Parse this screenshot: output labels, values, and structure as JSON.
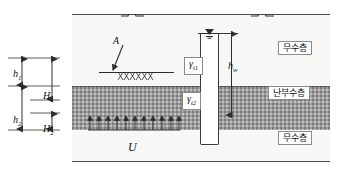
{
  "diagram": {
    "type": "geotechnical-cross-section"
  },
  "labels": {
    "point_A": "A",
    "uplift": "U",
    "gamma_t1": "γ",
    "gamma_t1_sub": "t1",
    "gamma_t2": "γ",
    "gamma_t2_sub": "t2",
    "h_w": "h",
    "h_w_sub": "w",
    "h1": "h",
    "h1_sub": "1",
    "h2": "h",
    "h2_sub": "2",
    "H1": "H",
    "H1_sub": "1",
    "H2": "H",
    "H2_sub": "2"
  },
  "strata": {
    "top_layer_caption": "무수층",
    "middle_layer_caption": "난부수층",
    "bottom_layer_caption": "무수층"
  },
  "icons": {
    "water_table": "water-table-icon",
    "break_left": "break-symbol-icon",
    "break_right": "break-symbol-icon",
    "uplift_arrows": "uplift-arrow-icon",
    "leader_arrow_A": "leader-arrow-icon",
    "hatching": "hatch-pattern-icon"
  },
  "geometry": {
    "uplift_arrow_count": 11
  },
  "colors": {
    "permeable_fill": "#f7f7f5",
    "semipermeable_fill": "#9d9d9d",
    "pile_fill": "#6e6e6e",
    "line": "#2e2e2e",
    "well_fill": "#ffffff"
  }
}
